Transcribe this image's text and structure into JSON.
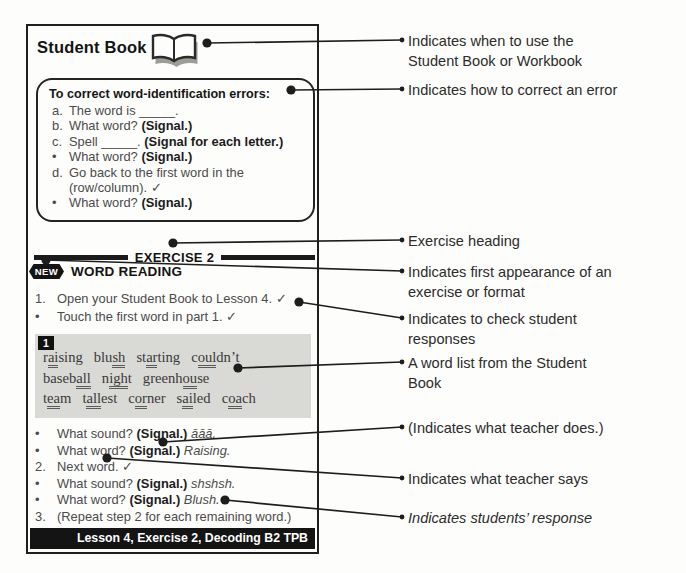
{
  "card": {
    "title": "Student Book",
    "icons": {
      "header_icon": "open-book-icon"
    },
    "correction_box": {
      "header": "To correct word-identification errors:",
      "lines": [
        {
          "marker": "a.",
          "say": "The word is _____."
        },
        {
          "marker": "b.",
          "say": "What word?",
          "does": "(Signal.)"
        },
        {
          "marker": "c.",
          "say": "Spell _____.",
          "does": "(Signal for each letter.)"
        },
        {
          "marker": "•",
          "say": "What word?",
          "does": "(Signal.)"
        },
        {
          "marker": "d.",
          "say": "Go back to the first word in the (row/column). ✓"
        },
        {
          "marker": "•",
          "say": "What word?",
          "does": "(Signal.)"
        }
      ]
    },
    "exercise_heading": "EXERCISE 2",
    "new_badge": "NEW",
    "exercise_title": "WORD READING",
    "steps": [
      {
        "marker": "1.",
        "say": "Open your Student Book to Lesson 4. ✓"
      },
      {
        "marker": "•",
        "say": "Touch the first word in part 1. ✓"
      }
    ],
    "word_box": {
      "part_number": "1",
      "rows": [
        {
          "words": [
            {
              "pre": "r",
              "ul": "ai",
              "post": "sing"
            },
            {
              "pre": "blu",
              "ul": "sh",
              "post": ""
            },
            {
              "pre": "st",
              "ul": "ar",
              "post": "ting"
            },
            {
              "pre": "c",
              "ul": "oul",
              "post": "dn’t"
            }
          ]
        },
        {
          "words": [
            {
              "pre": "baseb",
              "ul": "all",
              "post": ""
            },
            {
              "pre": "n",
              "ul": "igh",
              "post": "t"
            },
            {
              "pre": "greenh",
              "ul": "ou",
              "post": "se"
            }
          ]
        },
        {
          "words": [
            {
              "pre": "t",
              "ul": "ea",
              "post": "m"
            },
            {
              "pre": "t",
              "ul": "all",
              "post": "est"
            },
            {
              "pre": "c",
              "ul": "or",
              "post": "ner"
            },
            {
              "pre": "s",
              "ul": "ai",
              "post": "led"
            },
            {
              "pre": "c",
              "ul": "oa",
              "post": "ch"
            }
          ]
        }
      ]
    },
    "dialogue": [
      {
        "marker": "•",
        "say": "What sound?",
        "does": "(Signal.)",
        "response": "āāā."
      },
      {
        "marker": "•",
        "say": "What word?",
        "does": "(Signal.)",
        "response": "Raising."
      },
      {
        "marker": "2.",
        "say": "Next word. ✓"
      },
      {
        "marker": "•",
        "say": "What sound?",
        "does": "(Signal.)",
        "response": "shshsh."
      },
      {
        "marker": "•",
        "say": "What word?",
        "does": "(Signal.)",
        "response": "Blush."
      },
      {
        "marker": "3.",
        "say": "(Repeat step 2 for each remaining word.)"
      }
    ],
    "footer": "Lesson 4, Exercise 2, Decoding B2 TPB"
  },
  "annotations": [
    {
      "text": "Indicates when to use the Student Book or Workbook"
    },
    {
      "text": "Indicates how to correct an error"
    },
    {
      "text": "Exercise heading"
    },
    {
      "text": "Indicates first appearance of an exercise or format"
    },
    {
      "text": "Indicates to check student responses"
    },
    {
      "text": "A word list from the Student Book"
    },
    {
      "text": "(Indicates what teacher does.)"
    },
    {
      "text": "Indicates what teacher says"
    },
    {
      "text": "Indicates students’ response"
    }
  ]
}
